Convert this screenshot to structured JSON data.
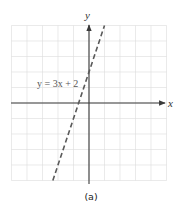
{
  "chart_data": {
    "type": "line",
    "title": "",
    "caption": "(a)",
    "xlabel": "x",
    "ylabel": "y",
    "xlim": [
      -5,
      5
    ],
    "ylim": [
      -5,
      5
    ],
    "grid": true,
    "tick_labels": false,
    "series": [
      {
        "name": "y = 3x + 2",
        "equation": "y = 3x + 2",
        "slope": 3,
        "intercept": 2,
        "style": "dashed",
        "x": [
          -2.333,
          -0.667,
          0,
          1
        ],
        "y": [
          -5,
          0,
          2,
          5
        ]
      }
    ],
    "annotations": [
      {
        "text": "y = 3x + 2",
        "position": "left of y-axis, near y-intercept (0, 2)"
      }
    ]
  },
  "labels": {
    "x_axis": "x",
    "y_axis": "y",
    "equation": "y = 3x + 2",
    "caption": "(a)"
  },
  "colors": {
    "grid": "#dcdcdc",
    "axis": "#3a3a3a",
    "line": "#5a5a5a"
  }
}
